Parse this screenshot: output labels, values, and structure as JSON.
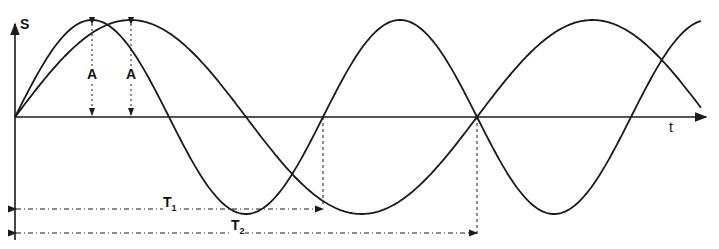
{
  "diagram": {
    "axes": {
      "y_label": "S",
      "x_label": "t"
    },
    "amplitude_label": "A",
    "period_labels": {
      "T1": "T",
      "T1_sub": "1",
      "T2": "T",
      "T2_sub": "2"
    },
    "stroke_color": "#1a1a1a"
  },
  "chart_data": {
    "type": "line",
    "title": "",
    "xlabel": "t",
    "ylabel": "S",
    "series": [
      {
        "name": "oscillation 1 (period T1)",
        "function": "A·sin(2πt/T1)",
        "period_ratio": 2
      },
      {
        "name": "oscillation 2 (period T2)",
        "function": "A·sin(2πt/T2)",
        "period_ratio": 3
      }
    ],
    "annotations": [
      "A (amplitude, both curves)",
      "T1 = period of curve 1",
      "T2 = period of curve 2",
      "T2 = 1.5·T1"
    ],
    "grid": false
  }
}
